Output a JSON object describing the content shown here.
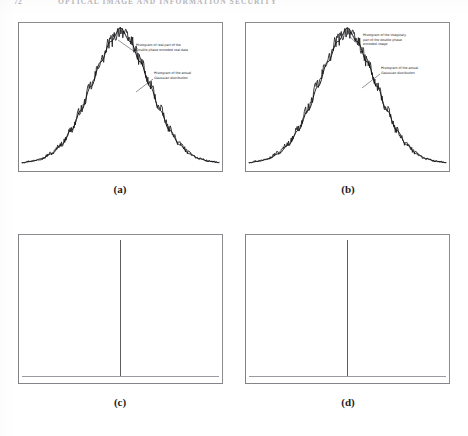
{
  "header": {
    "page_number": "72",
    "title": "OPTICAL IMAGE AND INFORMATION SECURITY"
  },
  "figure": {
    "captions": {
      "a": "(a)",
      "b": "(b)",
      "c": "(c)",
      "d": "(d)"
    },
    "annotations": {
      "a_encoded": "Histogram of real part of the\nDouble phase encoded real data",
      "a_gaussian": "Histogram of the actual\nGaussian distribution",
      "b_encoded": "Histogram of the imaginary\npart of the double phase\nencoded image",
      "b_gaussian": "Histogram of the actual\nGaussian distribution"
    }
  },
  "colors": {
    "frame": "#8d8d91",
    "curve": "#111114",
    "noise": "#1a1a1e",
    "impulse": "#4a4a50",
    "baseline": "#9a9a9f",
    "header_text": "#b9b9bd",
    "caption_text": "#1d1d1d",
    "annotation_text": "#2a2a2e",
    "page_background": "#ffffff"
  },
  "chart_data": [
    {
      "id": "panel-a",
      "type": "line",
      "title": "Histogram of real part of double phase encoded data vs actual Gaussian",
      "xlabel": "",
      "ylabel": "",
      "grid": false,
      "legend": "annotated-callouts",
      "xlim": [
        -4,
        4
      ],
      "ylim": [
        0,
        1
      ],
      "series": [
        {
          "name": "Histogram of real part of the Double phase encoded real data",
          "style": "noisy-histogram",
          "x": [
            -4.0,
            -3.6,
            -3.2,
            -2.8,
            -2.4,
            -2.0,
            -1.6,
            -1.2,
            -0.8,
            -0.4,
            0.0,
            0.4,
            0.8,
            1.2,
            1.6,
            2.0,
            2.4,
            2.8,
            3.2,
            3.6,
            4.0
          ],
          "values": [
            0.012,
            0.022,
            0.041,
            0.079,
            0.146,
            0.252,
            0.401,
            0.576,
            0.756,
            0.903,
            0.985,
            0.912,
            0.764,
            0.585,
            0.407,
            0.256,
            0.148,
            0.08,
            0.04,
            0.021,
            0.011
          ]
        },
        {
          "name": "Histogram of the actual Gaussian distribution",
          "style": "smooth-curve",
          "x": [
            -4.0,
            -3.6,
            -3.2,
            -2.8,
            -2.4,
            -2.0,
            -1.6,
            -1.2,
            -0.8,
            -0.4,
            0.0,
            0.4,
            0.8,
            1.2,
            1.6,
            2.0,
            2.4,
            2.8,
            3.2,
            3.6,
            4.0
          ],
          "values": [
            0.01,
            0.02,
            0.039,
            0.075,
            0.141,
            0.247,
            0.395,
            0.57,
            0.751,
            0.9,
            1.0,
            0.9,
            0.751,
            0.57,
            0.395,
            0.247,
            0.141,
            0.075,
            0.039,
            0.02,
            0.01
          ]
        }
      ]
    },
    {
      "id": "panel-b",
      "type": "line",
      "title": "Histogram of imaginary part of double phase encoded image vs actual Gaussian",
      "xlabel": "",
      "ylabel": "",
      "grid": false,
      "legend": "annotated-callouts",
      "xlim": [
        -4,
        4
      ],
      "ylim": [
        0,
        1
      ],
      "series": [
        {
          "name": "Histogram of the imaginary part of the double phase encoded image",
          "style": "noisy-histogram",
          "x": [
            -4.0,
            -3.6,
            -3.2,
            -2.8,
            -2.4,
            -2.0,
            -1.6,
            -1.2,
            -0.8,
            -0.4,
            0.0,
            0.4,
            0.8,
            1.2,
            1.6,
            2.0,
            2.4,
            2.8,
            3.2,
            3.6,
            4.0
          ],
          "values": [
            0.013,
            0.024,
            0.045,
            0.085,
            0.152,
            0.262,
            0.412,
            0.588,
            0.768,
            0.914,
            0.982,
            0.905,
            0.752,
            0.572,
            0.396,
            0.248,
            0.143,
            0.077,
            0.038,
            0.02,
            0.01
          ]
        },
        {
          "name": "Histogram of the actual Gaussian distribution",
          "style": "smooth-curve",
          "x": [
            -4.0,
            -3.6,
            -3.2,
            -2.8,
            -2.4,
            -2.0,
            -1.6,
            -1.2,
            -0.8,
            -0.4,
            0.0,
            0.4,
            0.8,
            1.2,
            1.6,
            2.0,
            2.4,
            2.8,
            3.2,
            3.6,
            4.0
          ],
          "values": [
            0.01,
            0.02,
            0.039,
            0.075,
            0.141,
            0.247,
            0.395,
            0.57,
            0.751,
            0.9,
            1.0,
            0.9,
            0.751,
            0.57,
            0.395,
            0.247,
            0.141,
            0.075,
            0.039,
            0.02,
            0.01
          ]
        }
      ]
    },
    {
      "id": "panel-c",
      "type": "line",
      "title": "Autocorrelation / delta impulse response",
      "xlabel": "",
      "ylabel": "",
      "grid": false,
      "xlim": [
        -4,
        4
      ],
      "ylim": [
        0,
        1
      ],
      "series": [
        {
          "name": "Impulse",
          "style": "impulse",
          "x": [
            0.0
          ],
          "values": [
            1.0
          ]
        },
        {
          "name": "Baseline",
          "style": "baseline",
          "x": [
            -4.0,
            4.0
          ],
          "values": [
            0.0,
            0.0
          ]
        }
      ]
    },
    {
      "id": "panel-d",
      "type": "line",
      "title": "Autocorrelation / delta impulse response",
      "xlabel": "",
      "ylabel": "",
      "grid": false,
      "xlim": [
        -4,
        4
      ],
      "ylim": [
        0,
        1
      ],
      "series": [
        {
          "name": "Impulse",
          "style": "impulse",
          "x": [
            0.0
          ],
          "values": [
            1.0
          ]
        },
        {
          "name": "Baseline",
          "style": "baseline",
          "x": [
            -4.0,
            4.0
          ],
          "values": [
            0.0,
            0.0
          ]
        }
      ]
    }
  ]
}
